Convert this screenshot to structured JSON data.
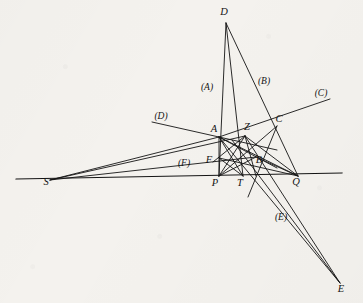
{
  "figure": {
    "background_color": "#f4f2ee",
    "stroke_color": "#141414",
    "canvas": {
      "width": 363,
      "height": 303
    }
  },
  "chart_data": {
    "type": "diagram",
    "xlabel": "",
    "ylabel": "",
    "xlim": [
      0,
      363
    ],
    "ylim": [
      0,
      303
    ],
    "grid": false,
    "legend": "none",
    "points": [
      {
        "name": "D",
        "label": "D",
        "x": 226,
        "y": 23,
        "label_x": 224,
        "label_y": 15
      },
      {
        "name": "A",
        "label": "A",
        "x": 219,
        "y": 137,
        "label_x": 214,
        "label_y": 132
      },
      {
        "name": "Z",
        "label": "Z",
        "x": 245,
        "y": 136,
        "label_x": 247,
        "label_y": 130
      },
      {
        "name": "C",
        "label": "C",
        "x": 277,
        "y": 126,
        "label_x": 279,
        "label_y": 122
      },
      {
        "name": "F",
        "label": "F",
        "x": 219,
        "y": 158,
        "label_x": 209,
        "label_y": 163
      },
      {
        "name": "B",
        "label": "B",
        "x": 256,
        "y": 157,
        "label_x": 259,
        "label_y": 163
      },
      {
        "name": "S",
        "label": "S",
        "x": 50,
        "y": 180,
        "label_x": 46,
        "label_y": 185
      },
      {
        "name": "P",
        "label": "P",
        "x": 219,
        "y": 176,
        "label_x": 215,
        "label_y": 186
      },
      {
        "name": "T",
        "label": "T",
        "x": 243,
        "y": 176,
        "label_x": 240,
        "label_y": 186
      },
      {
        "name": "Q",
        "label": "Q",
        "x": 298,
        "y": 176,
        "label_x": 296,
        "label_y": 185
      },
      {
        "name": "E",
        "label": "E",
        "x": 340,
        "y": 283,
        "label_x": 341,
        "label_y": 292
      }
    ],
    "ray_labels": [
      {
        "name": "ray-A",
        "label": "(A)",
        "x": 207,
        "y": 90
      },
      {
        "name": "ray-B",
        "label": "(B)",
        "x": 264,
        "y": 84
      },
      {
        "name": "ray-C",
        "label": "(C)",
        "x": 321,
        "y": 96
      },
      {
        "name": "ray-D",
        "label": "(D)",
        "x": 161,
        "y": 119
      },
      {
        "name": "ray-E",
        "label": "(E)",
        "x": 281,
        "y": 220
      },
      {
        "name": "ray-F",
        "label": "(F)",
        "x": 184,
        "y": 166
      }
    ],
    "base_line": {
      "name": "base-line",
      "x1": 16,
      "y1": 179,
      "x2": 342,
      "y2": 173
    },
    "segments": [
      {
        "name": "seg-D-P",
        "from": "D",
        "to": "P",
        "x1": 226,
        "y1": 23,
        "x2": 219,
        "y2": 176
      },
      {
        "name": "seg-D-T",
        "from": "D",
        "to": "T",
        "x1": 226,
        "y1": 23,
        "x2": 243,
        "y2": 176
      },
      {
        "name": "seg-D-Q",
        "from": "D",
        "to": "Q",
        "x1": 226,
        "y1": 23,
        "x2": 298,
        "y2": 176
      },
      {
        "name": "seg-S-A",
        "from": "S",
        "to": "A",
        "x1": 50,
        "y1": 180,
        "x2": 219,
        "y2": 137
      },
      {
        "name": "seg-S-Z",
        "from": "S",
        "to": "Z",
        "x1": 50,
        "y1": 180,
        "x2": 245,
        "y2": 136
      },
      {
        "name": "seg-S-B",
        "from": "S",
        "to": "B",
        "x1": 50,
        "y1": 180,
        "x2": 256,
        "y2": 157
      },
      {
        "name": "seg-A-ext-C",
        "from": "A",
        "to": "C-ext",
        "x1": 219,
        "y1": 137,
        "x2": 330,
        "y2": 99
      },
      {
        "name": "seg-Dray-A",
        "from": "D-ray",
        "to": "A",
        "x1": 152,
        "y1": 122,
        "x2": 277,
        "y2": 150
      },
      {
        "name": "seg-E-Z",
        "from": "E",
        "to": "Z",
        "x1": 340,
        "y1": 283,
        "x2": 245,
        "y2": 136
      },
      {
        "name": "seg-E-B",
        "from": "E",
        "to": "B",
        "x1": 340,
        "y1": 283,
        "x2": 219,
        "y2": 137
      },
      {
        "name": "seg-E-P",
        "from": "E",
        "to": "P",
        "x1": 340,
        "y1": 283,
        "x2": 232,
        "y2": 140
      },
      {
        "name": "seg-A-Q",
        "from": "A",
        "to": "Q",
        "x1": 219,
        "y1": 137,
        "x2": 298,
        "y2": 176
      },
      {
        "name": "seg-Z-Q",
        "from": "Z",
        "to": "Q",
        "x1": 245,
        "y1": 136,
        "x2": 298,
        "y2": 176
      },
      {
        "name": "seg-F-Q",
        "from": "F",
        "to": "Q",
        "x1": 219,
        "y1": 158,
        "x2": 298,
        "y2": 176
      },
      {
        "name": "seg-B-Q",
        "from": "B",
        "to": "Q",
        "x1": 256,
        "y1": 157,
        "x2": 298,
        "y2": 176
      },
      {
        "name": "seg-A-T",
        "from": "A",
        "to": "T",
        "x1": 219,
        "y1": 137,
        "x2": 243,
        "y2": 176
      },
      {
        "name": "seg-Z-P",
        "from": "Z",
        "to": "P",
        "x1": 245,
        "y1": 136,
        "x2": 219,
        "y2": 176
      },
      {
        "name": "seg-F-T",
        "from": "F",
        "to": "T",
        "x1": 219,
        "y1": 158,
        "x2": 243,
        "y2": 176
      },
      {
        "name": "seg-B-P",
        "from": "B",
        "to": "P",
        "x1": 256,
        "y1": 157,
        "x2": 219,
        "y2": 176
      },
      {
        "name": "seg-A-F",
        "from": "A",
        "to": "F",
        "x1": 219,
        "y1": 137,
        "x2": 219,
        "y2": 176
      },
      {
        "name": "seg-Z-B",
        "from": "Z",
        "to": "B",
        "x1": 245,
        "y1": 136,
        "x2": 256,
        "y2": 176
      },
      {
        "name": "seg-A-B",
        "from": "A",
        "to": "B",
        "x1": 219,
        "y1": 137,
        "x2": 277,
        "y2": 168
      },
      {
        "name": "seg-Z-F",
        "from": "Z",
        "to": "F",
        "x1": 245,
        "y1": 136,
        "x2": 213,
        "y2": 162
      },
      {
        "name": "seg-C-P",
        "from": "C",
        "to": "P",
        "x1": 277,
        "y1": 126,
        "x2": 219,
        "y2": 176
      },
      {
        "name": "seg-C-T",
        "from": "C",
        "to": "T",
        "x1": 277,
        "y1": 126,
        "x2": 248,
        "y2": 197
      }
    ]
  }
}
